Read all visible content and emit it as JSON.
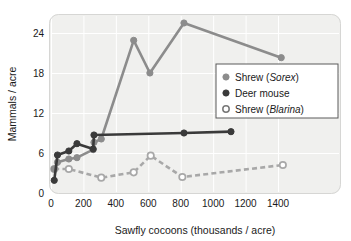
{
  "chart_data": {
    "type": "line",
    "title": "",
    "xlabel": "Sawfly cocoons (thousands / acre)",
    "ylabel": "Mammals / acre",
    "xlim": [
      0,
      1500
    ],
    "ylim": [
      0,
      27
    ],
    "xticks": [
      0,
      200,
      400,
      600,
      800,
      1000,
      1200,
      1400
    ],
    "xtick_labels": [
      "0",
      "200",
      "400",
      "600",
      "800",
      "1000",
      "1200",
      "1400"
    ],
    "yticks": [
      0,
      6,
      12,
      18,
      24
    ],
    "ytick_labels": [
      "0",
      "6",
      "12",
      "18",
      "24"
    ],
    "grid": true,
    "legend_position": "right",
    "plot_bg": "#f0f0ee",
    "grid_color": "#ffffff",
    "series": [
      {
        "name": "Shrew (Sorex)",
        "legend_prefix": "Shrew (",
        "legend_italic": "Sorex",
        "legend_suffix": ")",
        "color": "#8c8c8c",
        "marker": "filled-circle",
        "linestyle": "solid",
        "x": [
          20,
          40,
          110,
          160,
          260,
          265,
          310,
          510,
          610,
          820,
          1420
        ],
        "y": [
          3.6,
          4.6,
          5.1,
          5.3,
          6.5,
          7.6,
          8.1,
          22.9,
          18.0,
          25.5,
          20.3
        ]
      },
      {
        "name": "Deer mouse",
        "legend_prefix": "Deer mouse",
        "legend_italic": "",
        "legend_suffix": "",
        "color": "#3a3a3a",
        "marker": "filled-circle",
        "linestyle": "solid",
        "x": [
          20,
          40,
          110,
          160,
          260,
          265,
          820,
          1110
        ],
        "y": [
          1.9,
          5.7,
          6.3,
          7.4,
          6.6,
          8.7,
          9.0,
          9.2
        ]
      },
      {
        "name": "Shrew (Blarina)",
        "legend_prefix": "Shrew (",
        "legend_italic": "Blarina",
        "legend_suffix": ")",
        "color": "#a8a8a8",
        "marker": "open-circle",
        "linestyle": "dashed",
        "x": [
          20,
          110,
          310,
          510,
          615,
          810,
          1430
        ],
        "y": [
          3.6,
          3.6,
          2.3,
          3.1,
          5.6,
          2.4,
          4.2
        ]
      }
    ]
  },
  "legend": {
    "items": [
      {
        "marker": "filled-circle",
        "color": "#8c8c8c",
        "prefix": "Shrew (",
        "italic": "Sorex",
        "suffix": ")"
      },
      {
        "marker": "filled-circle",
        "color": "#3a3a3a",
        "prefix": "Deer mouse",
        "italic": "",
        "suffix": ""
      },
      {
        "marker": "open-circle",
        "color": "#ffffff",
        "prefix": "Shrew (",
        "italic": "Blarina",
        "suffix": ")"
      }
    ]
  }
}
